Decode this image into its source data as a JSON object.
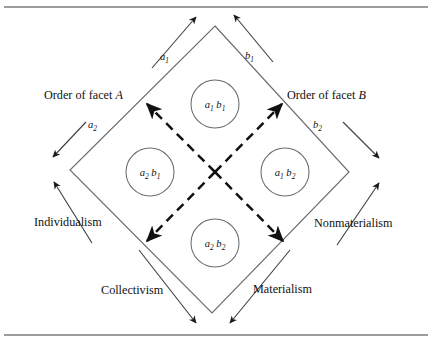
{
  "figure": {
    "type": "facet-mapping-diamond",
    "background_color": "#ffffff",
    "line_color": "#58595b",
    "dashed_color": "#111111",
    "text_color": "#111111"
  },
  "rules": {
    "top_rule_label": "top-horizontal-rule",
    "bottom_rule_label": "bottom-horizontal-rule"
  },
  "facet_axes": {
    "facet_a_title": "Order of facet A",
    "facet_a_title_plain": "Order of facet ",
    "facet_a_title_italic": "A",
    "facet_b_title": "Order of facet B",
    "facet_b_title_plain": "Order of facet ",
    "facet_b_title_italic": "B"
  },
  "direction_labels": [
    {
      "id": "a1",
      "base": "a",
      "sub": "1",
      "position": "upper-left",
      "arrow": "up-right"
    },
    {
      "id": "b1",
      "base": "b",
      "sub": "1",
      "position": "upper-right",
      "arrow": "up-left"
    },
    {
      "id": "a2",
      "base": "a",
      "sub": "2",
      "position": "lower-left",
      "arrow": "down-left"
    },
    {
      "id": "b2",
      "base": "b",
      "sub": "2",
      "position": "lower-right",
      "arrow": "down-right"
    }
  ],
  "pole_labels": {
    "individualism": "Individualism",
    "collectivism": "Collectivism",
    "materialism": "Materialism",
    "nonmaterialism": "Nonmaterialism"
  },
  "cells": [
    {
      "id": "cell-a1b1",
      "first_base": "a",
      "first_sub": "1",
      "second_base": "b",
      "second_sub": "1",
      "quadrant": "top",
      "cx": 215,
      "cy": 104,
      "r": 24
    },
    {
      "id": "cell-a2b1",
      "first_base": "a",
      "first_sub": "2",
      "second_base": "b",
      "second_sub": "1",
      "quadrant": "left",
      "cx": 150,
      "cy": 172,
      "r": 24
    },
    {
      "id": "cell-a1b2",
      "first_base": "a",
      "first_sub": "1",
      "second_base": "b",
      "second_sub": "2",
      "quadrant": "right",
      "cx": 285,
      "cy": 172,
      "r": 24
    },
    {
      "id": "cell-a2b2",
      "first_base": "a",
      "first_sub": "2",
      "second_base": "b",
      "second_sub": "2",
      "quadrant": "bottom",
      "cx": 215,
      "cy": 243,
      "r": 24
    }
  ],
  "diamond": {
    "top": {
      "x": 215,
      "y": 26
    },
    "left": {
      "x": 70,
      "y": 170
    },
    "right": {
      "x": 349,
      "y": 172
    },
    "bottom": {
      "x": 212,
      "y": 313
    }
  }
}
